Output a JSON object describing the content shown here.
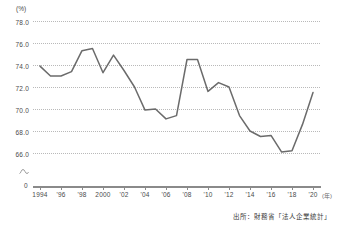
{
  "chart_data": {
    "type": "line",
    "title": "",
    "subtitle": "",
    "xlabel": "(年)",
    "ylabel": "(%)",
    "ylim": [
      65.0,
      78.0
    ],
    "xlim": [
      1994,
      2020
    ],
    "grid": true,
    "legend": false,
    "axis_break": true,
    "line_color": "#6b6b6b",
    "grid_color": "#b9b9b9",
    "yticks": [
      78.0,
      76.0,
      74.0,
      72.0,
      70.0,
      68.0,
      66.0
    ],
    "ytick_labels": [
      "78.0",
      "76.0",
      "74.0",
      "72.0",
      "70.0",
      "68.0",
      "66.0"
    ],
    "y_zero_label": "0",
    "xticks": [
      1994,
      1996,
      1998,
      2000,
      2002,
      2004,
      2006,
      2008,
      2010,
      2012,
      2014,
      2016,
      2018,
      2020
    ],
    "xtick_labels": [
      "1994",
      "'96",
      "'98",
      "2000",
      "'02",
      "'04",
      "'06",
      "'08",
      "'10",
      "'12",
      "'14",
      "'16",
      "'18",
      "'20"
    ],
    "x": [
      1994,
      1995,
      1996,
      1997,
      1998,
      1999,
      2000,
      2001,
      2002,
      2003,
      2004,
      2005,
      2006,
      2007,
      2008,
      2009,
      2010,
      2011,
      2012,
      2013,
      2014,
      2015,
      2016,
      2017,
      2018,
      2019,
      2020
    ],
    "values": [
      73.9,
      73.0,
      73.0,
      73.4,
      75.3,
      75.5,
      73.3,
      74.9,
      73.5,
      72.0,
      69.9,
      70.0,
      69.1,
      69.4,
      74.5,
      74.5,
      71.6,
      72.4,
      72.0,
      69.4,
      68.0,
      67.5,
      67.6,
      66.1,
      66.2,
      68.6,
      71.5
    ],
    "series": [
      {
        "name": "労働分配率",
        "values": [
          73.9,
          73.0,
          73.0,
          73.4,
          75.3,
          75.5,
          73.3,
          74.9,
          73.5,
          72.0,
          69.9,
          70.0,
          69.1,
          69.4,
          74.5,
          74.5,
          71.6,
          72.4,
          72.0,
          69.4,
          68.0,
          67.5,
          67.6,
          66.1,
          66.2,
          68.6,
          71.5
        ]
      }
    ],
    "annotations": []
  },
  "source": {
    "note": "出所：財務省「法人企業統計」"
  }
}
